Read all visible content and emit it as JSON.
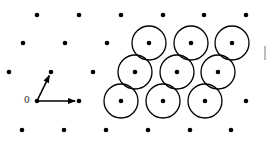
{
  "diagram": {
    "origin_label": "0",
    "lattice_points": [
      [
        37,
        15
      ],
      [
        79,
        15
      ],
      [
        121,
        15
      ],
      [
        163,
        15
      ],
      [
        204,
        15
      ],
      [
        246,
        15
      ],
      [
        23,
        43
      ],
      [
        65,
        43
      ],
      [
        107,
        43
      ],
      [
        149,
        43
      ],
      [
        191,
        43
      ],
      [
        232,
        43
      ],
      [
        9,
        72
      ],
      [
        51,
        72
      ],
      [
        93,
        72
      ],
      [
        135,
        72
      ],
      [
        177,
        72
      ],
      [
        218,
        72
      ],
      [
        37,
        101
      ],
      [
        79,
        101
      ],
      [
        121,
        101
      ],
      [
        163,
        101
      ],
      [
        205,
        101
      ],
      [
        246,
        101
      ],
      [
        22,
        130
      ],
      [
        64,
        130
      ],
      [
        106,
        130
      ],
      [
        148,
        130
      ],
      [
        190,
        130
      ],
      [
        231,
        130
      ]
    ],
    "circled_points": [
      [
        149,
        43
      ],
      [
        191,
        43
      ],
      [
        232,
        43
      ],
      [
        135,
        72
      ],
      [
        177,
        72
      ],
      [
        218,
        72
      ],
      [
        121,
        101
      ],
      [
        163,
        101
      ],
      [
        205,
        101
      ]
    ],
    "circle_radius": 17,
    "basis_vectors": [
      {
        "from": [
          37,
          101
        ],
        "to": [
          79,
          101
        ]
      },
      {
        "from": [
          37,
          101
        ],
        "to": [
          51,
          72
        ]
      }
    ]
  }
}
